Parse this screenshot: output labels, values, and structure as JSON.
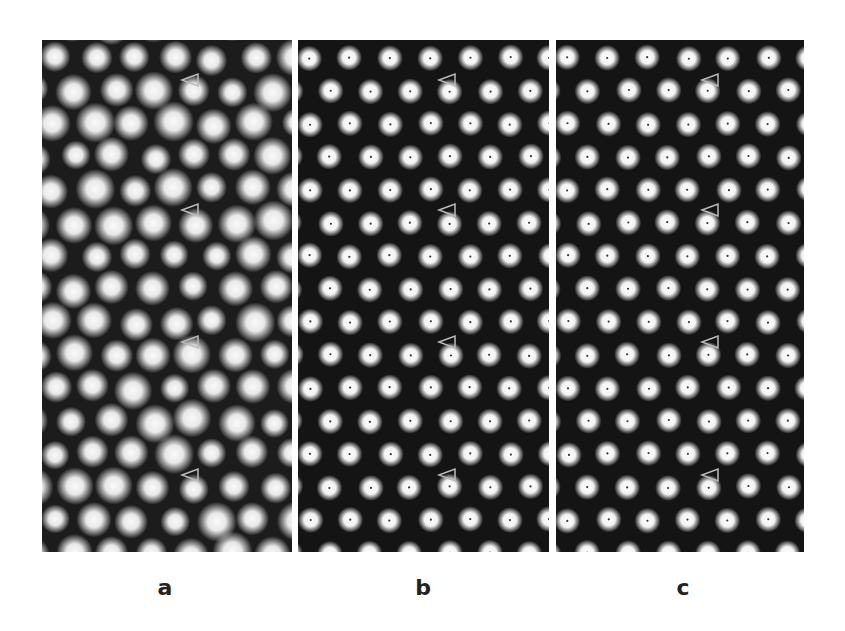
{
  "figure": {
    "panels": [
      {
        "id": "a",
        "label": "a",
        "style": "blurred-noisy-lattice",
        "arrow_y": [
          63,
          193,
          325,
          458
        ]
      },
      {
        "id": "b",
        "label": "b",
        "style": "sharp-lattice-with-center-dots",
        "arrow_y": [
          63,
          193,
          325,
          458
        ]
      },
      {
        "id": "c",
        "label": "c",
        "style": "sharp-lattice-with-dimer-defects",
        "arrow_y": [
          63,
          193,
          325,
          458
        ]
      }
    ],
    "marker": "open-triangle-arrowhead-pointing-left",
    "colors": {
      "background": "#ffffff",
      "panel": "#141414",
      "dot": "#f4f4f4",
      "marker": "#bbbbbb"
    }
  }
}
